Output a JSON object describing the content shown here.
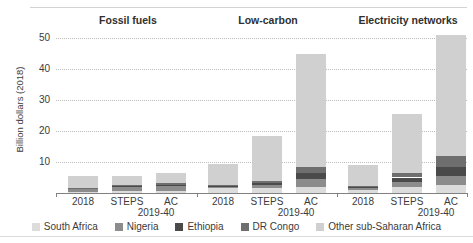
{
  "axis": {
    "y_title": "Billion dollars (2018)",
    "y_ticks": [
      "10",
      "20",
      "30",
      "40",
      "50"
    ]
  },
  "groups": [
    {
      "title": "Fossil fuels"
    },
    {
      "title": "Low-carbon"
    },
    {
      "title": "Electricity networks"
    }
  ],
  "x_labels": [
    "2018",
    "STEPS",
    "AC"
  ],
  "x_sublabel": "2019-40",
  "legend": [
    {
      "label": "South Africa",
      "color": "#dcdcdc"
    },
    {
      "label": "Nigeria",
      "color": "#8c8c8c"
    },
    {
      "label": "Ethiopia",
      "color": "#4a4a4a"
    },
    {
      "label": "DR Congo",
      "color": "#6e6e6e"
    },
    {
      "label": "Other sub-Saharan Africa",
      "color": "#d0d0d0"
    }
  ],
  "colors": {
    "south_africa": "#dcdcdc",
    "nigeria": "#8c8c8c",
    "ethiopia": "#4a4a4a",
    "dr_congo": "#6e6e6e",
    "other": "#d0d0d0",
    "gridline": "#bdbdbd",
    "axis": "#808080",
    "text": "#3b3b3b"
  },
  "chart_data": {
    "type": "bar",
    "title": "",
    "subtitle": "",
    "xlabel": "",
    "ylabel": "Billion dollars (2018)",
    "ylim": [
      0,
      55
    ],
    "grid": true,
    "stacked": true,
    "legend_position": "bottom",
    "group_labels": [
      "Fossil fuels",
      "Low-carbon",
      "Electricity networks"
    ],
    "categories": [
      "Fossil fuels 2018",
      "Fossil fuels STEPS 2019-40",
      "Fossil fuels AC 2019-40",
      "Low-carbon 2018",
      "Low-carbon STEPS 2019-40",
      "Low-carbon AC 2019-40",
      "Electricity networks 2018",
      "Electricity networks STEPS 2019-40",
      "Electricity networks AC 2019-40"
    ],
    "series": [
      {
        "name": "South Africa",
        "values": [
          0.4,
          0.5,
          0.5,
          1.6,
          1.5,
          2.0,
          1.0,
          2.0,
          2.5
        ]
      },
      {
        "name": "Nigeria",
        "values": [
          0.8,
          1.3,
          1.6,
          0.5,
          1.0,
          2.5,
          0.5,
          1.5,
          3.0
        ]
      },
      {
        "name": "Ethiopia",
        "values": [
          0.3,
          0.5,
          0.6,
          0.3,
          0.8,
          2.0,
          0.3,
          1.5,
          3.0
        ]
      },
      {
        "name": "DR Congo",
        "values": [
          0.2,
          0.4,
          0.5,
          0.3,
          0.7,
          2.0,
          0.3,
          1.5,
          3.5
        ]
      },
      {
        "name": "Other sub-Saharan Africa",
        "values": [
          3.8,
          2.8,
          3.3,
          6.8,
          14.5,
          36.5,
          6.9,
          19.0,
          39.0
        ]
      }
    ],
    "totals": [
      5.5,
      5.5,
      6.5,
      9.5,
      18.5,
      45.0,
      9.0,
      25.5,
      51.0
    ]
  }
}
